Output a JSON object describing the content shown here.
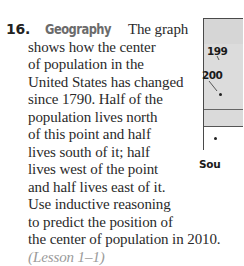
{
  "exercise": {
    "number": "16.",
    "topic": "Geography",
    "lines": [
      "The graph",
      "shows how the center",
      "of population in the",
      "United States has changed",
      "since 1790. Half of the",
      "population lives north",
      "of this point and half",
      "lives south of it; half",
      "lives west of the point",
      "and half lives east of it.",
      "Use inductive reasoning",
      "to predict the position of",
      "the center of population in 2010."
    ],
    "lesson_ref": "(Lesson 1–1)"
  },
  "map": {
    "labels": [
      "199",
      "200"
    ],
    "source_label": "Sou",
    "colors": {
      "shading": "#d9d9d9",
      "border": "#4a4a4a",
      "legend_bg": "#ffffff"
    }
  }
}
